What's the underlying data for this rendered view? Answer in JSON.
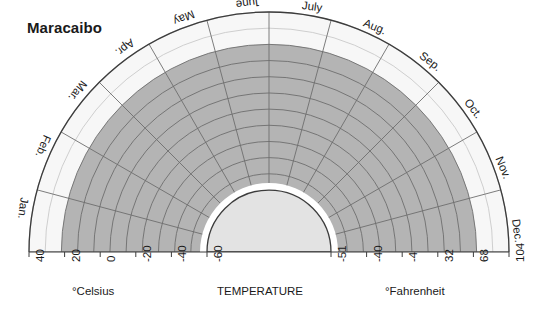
{
  "title": "Maracaibo",
  "axis": {
    "celsius_label": "°Celsius",
    "temperature_label": "TEMPERATURE",
    "fahrenheit_label": "°Fahrenheit"
  },
  "colors": {
    "band_fill": "#b4b4b4",
    "inner_fill": "#e3e3e3",
    "outer_fill": "#f7f7f7",
    "grid_line": "#6e6e6e",
    "faint_line": "#c9c9c9",
    "outline": "#3c3c3c",
    "text": "#1a1a1a"
  },
  "chart_data": {
    "type": "line",
    "chart_style": "semicircular-polar-climogram",
    "title": "Maracaibo",
    "xlabel": "TEMPERATURE",
    "ylabel": "",
    "angular_categories": [
      "Jan.",
      "Feb.",
      "Mar.",
      "Apr.",
      "May",
      "June",
      "July",
      "Aug.",
      "Sep.",
      "Oct.",
      "Nov.",
      "Dec."
    ],
    "radial_axis": {
      "left_scale_name": "°Celsius",
      "left_tick_labels": [
        "40",
        "20",
        "0",
        "-20",
        "-40",
        "-60"
      ],
      "left_tick_values": [
        40,
        20,
        0,
        -20,
        -40,
        -60
      ],
      "right_scale_name": "°Fahrenheit",
      "right_tick_labels": [
        "-51",
        "-40",
        "-4",
        "32",
        "68",
        "104"
      ],
      "right_tick_values": [
        -51,
        -40,
        -4,
        32,
        68,
        104
      ],
      "direction": "outer edge = warmest (40°C / 104°F), center = coldest (-60°C / -51°F)",
      "ring_count": 11,
      "grid": true
    },
    "legend": [],
    "annotations": [],
    "series": [
      {
        "name": "Monthly mean temperature band (outer bound, °C)",
        "categories": [
          "Jan.",
          "Feb.",
          "Mar.",
          "Apr.",
          "May",
          "June",
          "July",
          "Aug.",
          "Sep.",
          "Oct.",
          "Nov.",
          "Dec."
        ],
        "values": [
          28,
          28,
          29,
          30,
          30,
          30,
          30,
          30,
          30,
          29,
          29,
          28
        ]
      },
      {
        "name": "Shaded band inner bound (°C)",
        "categories": [
          "Jan.",
          "Feb.",
          "Mar.",
          "Apr.",
          "May",
          "June",
          "July",
          "Aug.",
          "Sep.",
          "Oct.",
          "Nov.",
          "Dec."
        ],
        "values": [
          -60,
          -60,
          -60,
          -60,
          -60,
          -60,
          -60,
          -60,
          -60,
          -60,
          -60,
          -60
        ]
      }
    ]
  },
  "months": [
    {
      "label": "Jan."
    },
    {
      "label": "Feb."
    },
    {
      "label": "Mar."
    },
    {
      "label": "Apr."
    },
    {
      "label": "May"
    },
    {
      "label": "June"
    },
    {
      "label": "July"
    },
    {
      "label": "Aug."
    },
    {
      "label": "Sep."
    },
    {
      "label": "Oct."
    },
    {
      "label": "Nov."
    },
    {
      "label": "Dec."
    }
  ],
  "left_ticks": [
    {
      "label": "40"
    },
    {
      "label": "20"
    },
    {
      "label": "0"
    },
    {
      "label": "-20"
    },
    {
      "label": "-40"
    },
    {
      "label": "-60"
    }
  ],
  "right_ticks": [
    {
      "label": "-51"
    },
    {
      "label": "-40"
    },
    {
      "label": "-4"
    },
    {
      "label": "32"
    },
    {
      "label": "68"
    },
    {
      "label": "104"
    }
  ]
}
